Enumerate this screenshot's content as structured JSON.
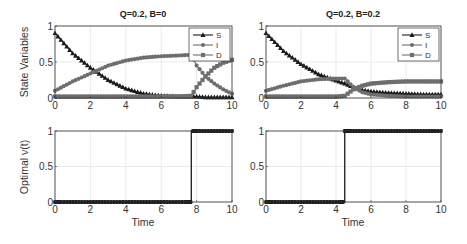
{
  "chart_data": [
    {
      "type": "line",
      "title": "Q=0.2, B=0",
      "xlabel": "",
      "ylabel": "State Variables",
      "xlim": [
        0,
        10
      ],
      "ylim": [
        0,
        1
      ],
      "xticks": [
        "0",
        "2",
        "4",
        "6",
        "8",
        "10"
      ],
      "yticks": [
        "0",
        "0.5",
        "1"
      ],
      "grid": true,
      "legend": {
        "position": "upper right",
        "entries": [
          "S",
          "I",
          "D"
        ]
      },
      "x": [
        0,
        1,
        2,
        3,
        4,
        5,
        6,
        7,
        7.7,
        8,
        8.5,
        9,
        9.5,
        10
      ],
      "series": [
        {
          "name": "S",
          "marker": "triangle",
          "values": [
            0.9,
            0.62,
            0.42,
            0.25,
            0.13,
            0.06,
            0.03,
            0.02,
            0.02,
            0.02,
            0.01,
            0.01,
            0.01,
            0.01
          ]
        },
        {
          "name": "I",
          "marker": "circle",
          "values": [
            0.1,
            0.23,
            0.34,
            0.45,
            0.52,
            0.56,
            0.58,
            0.59,
            0.6,
            0.45,
            0.3,
            0.2,
            0.12,
            0.06
          ]
        },
        {
          "name": "D",
          "marker": "square",
          "values": [
            0.02,
            0.02,
            0.02,
            0.02,
            0.02,
            0.02,
            0.02,
            0.02,
            0.03,
            0.15,
            0.3,
            0.42,
            0.49,
            0.53
          ]
        }
      ]
    },
    {
      "type": "line",
      "title": "Q=0.2, B=0.2",
      "xlabel": "",
      "ylabel": "",
      "xlim": [
        0,
        10
      ],
      "ylim": [
        0,
        1
      ],
      "xticks": [
        "0",
        "2",
        "4",
        "6",
        "8",
        "10"
      ],
      "yticks": [
        "0",
        "0.5",
        "1"
      ],
      "grid": true,
      "legend": {
        "position": "upper right",
        "entries": [
          "S",
          "I",
          "D"
        ]
      },
      "x": [
        0,
        1,
        2,
        3,
        4,
        4.5,
        5,
        5.5,
        6,
        7,
        8,
        9,
        10
      ],
      "series": [
        {
          "name": "S",
          "marker": "triangle",
          "values": [
            0.9,
            0.65,
            0.47,
            0.33,
            0.24,
            0.2,
            0.15,
            0.11,
            0.09,
            0.07,
            0.06,
            0.05,
            0.05
          ]
        },
        {
          "name": "I",
          "marker": "circle",
          "values": [
            0.1,
            0.17,
            0.23,
            0.26,
            0.27,
            0.27,
            0.15,
            0.08,
            0.05,
            0.03,
            0.02,
            0.02,
            0.02
          ]
        },
        {
          "name": "D",
          "marker": "square",
          "values": [
            0.02,
            0.02,
            0.02,
            0.02,
            0.02,
            0.03,
            0.12,
            0.17,
            0.2,
            0.22,
            0.23,
            0.23,
            0.23
          ]
        }
      ]
    },
    {
      "type": "line",
      "title": "",
      "xlabel": "Time",
      "ylabel": "Optimal ν(t)",
      "xlim": [
        0,
        10
      ],
      "ylim": [
        0,
        1
      ],
      "xticks": [
        "0",
        "2",
        "4",
        "6",
        "8",
        "10"
      ],
      "yticks": [
        "0",
        "0.5",
        "1"
      ],
      "grid": true,
      "switch_time": 7.7,
      "x": [
        0,
        7.7,
        7.7,
        10
      ],
      "series": [
        {
          "name": "nu",
          "marker": "star",
          "values": [
            0,
            0,
            1,
            1
          ]
        }
      ]
    },
    {
      "type": "line",
      "title": "",
      "xlabel": "Time",
      "ylabel": "",
      "xlim": [
        0,
        10
      ],
      "ylim": [
        0,
        1
      ],
      "xticks": [
        "0",
        "2",
        "4",
        "6",
        "8",
        "10"
      ],
      "yticks": [
        "0",
        "0.5",
        "1"
      ],
      "grid": true,
      "switch_time": 4.5,
      "x": [
        0,
        4.5,
        4.5,
        10
      ],
      "series": [
        {
          "name": "nu",
          "marker": "star",
          "values": [
            0,
            0,
            1,
            1
          ]
        }
      ]
    }
  ],
  "panels": {
    "tl": {
      "title": "Q=0.2, B=0",
      "ylabel": "State Variables"
    },
    "tr": {
      "title": "Q=0.2, B=0.2"
    },
    "bl": {
      "ylabel": "Optimal ν(t)",
      "xlabel": "Time"
    },
    "br": {
      "xlabel": "Time"
    }
  },
  "legend": {
    "s": "S",
    "i": "I",
    "d": "D"
  },
  "colors": {
    "S": "#1a1a1a",
    "I": "#6e6e6e",
    "D": "#6e6e6e",
    "nu": "#1a1a1a",
    "grid": "#e6e6e6",
    "axis": "#333333"
  }
}
